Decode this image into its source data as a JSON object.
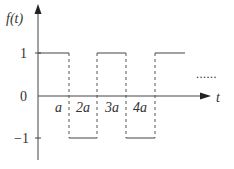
{
  "diagram": {
    "type": "square-wave-plot",
    "y_axis_label": "f(t)",
    "x_axis_label": "t",
    "y_ticks": [
      {
        "label": "1",
        "value": 1
      },
      {
        "label": "0",
        "value": 0
      },
      {
        "label": "−1",
        "value": -1
      }
    ],
    "x_ticks": [
      {
        "label": "a",
        "value": 1
      },
      {
        "label": "2a",
        "value": 2
      },
      {
        "label": "3a",
        "value": 3
      },
      {
        "label": "4a",
        "value": 4
      }
    ],
    "continuation": "......",
    "segments": [
      {
        "from": "0",
        "to": "a",
        "level": 1
      },
      {
        "from": "a",
        "to": "2a",
        "level": -1
      },
      {
        "from": "2a",
        "to": "3a",
        "level": 1
      },
      {
        "from": "3a",
        "to": "4a",
        "level": -1
      },
      {
        "from": "4a",
        "to": "…",
        "level": 1
      }
    ],
    "colors": {
      "line": "#333333",
      "dashed": "#555555"
    }
  }
}
